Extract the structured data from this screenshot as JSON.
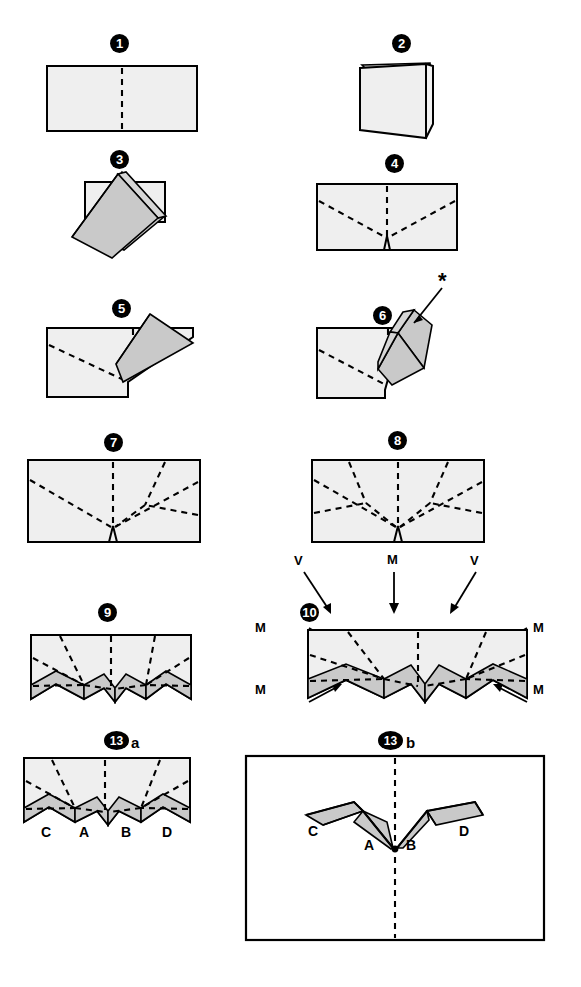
{
  "document": {
    "type": "origami-folding-instructions",
    "width": 581,
    "height": 987,
    "background": "#ffffff",
    "paper_fill": "#efefef",
    "shaded_fill": "#c9c9c9",
    "line_color": "#000000"
  },
  "steps": [
    {
      "id": "step-1",
      "badge": "1",
      "sublabel": "",
      "description": "flat rectangle with vertical center crease"
    },
    {
      "id": "step-2",
      "badge": "2",
      "sublabel": "",
      "description": "paper folded in half standing open like a book"
    },
    {
      "id": "step-3",
      "badge": "3",
      "sublabel": "",
      "description": "diagonal fold pulled down to the left"
    },
    {
      "id": "step-4",
      "badge": "4",
      "sublabel": "",
      "description": "rectangle with V creases meeting at bottom notch"
    },
    {
      "id": "step-5",
      "badge": "5",
      "sublabel": "",
      "description": "shaded flap swung up to the right"
    },
    {
      "id": "step-6",
      "badge": "6",
      "sublabel": "",
      "description": "flap refolded, asterisk marks new crease"
    },
    {
      "id": "step-7",
      "badge": "7",
      "sublabel": "",
      "description": "extra creases fanned on the right half"
    },
    {
      "id": "step-8",
      "badge": "8",
      "sublabel": "",
      "description": "symmetric fan creases on both halves"
    },
    {
      "id": "step-9",
      "badge": "9",
      "sublabel": "",
      "description": "shaded zigzag bands formed along the lower edge"
    },
    {
      "id": "step-10",
      "badge": "10",
      "sublabel": "",
      "description": "mountain and valley assignment with arrows"
    },
    {
      "id": "step-13a",
      "badge": "13",
      "sublabel": "a",
      "description": "labelled flaps C A B D before collapse"
    },
    {
      "id": "step-13b",
      "badge": "13",
      "sublabel": "b",
      "description": "finished wing form inside frame"
    }
  ],
  "annotations": {
    "asterisk": "*",
    "fold_markers": [
      {
        "label": "V",
        "position": "top-left"
      },
      {
        "label": "M",
        "position": "top-center"
      },
      {
        "label": "V",
        "position": "top-right"
      },
      {
        "label": "M",
        "position": "left-upper"
      },
      {
        "label": "M",
        "position": "right-upper"
      },
      {
        "label": "M",
        "position": "left-lower"
      },
      {
        "label": "M",
        "position": "right-lower"
      }
    ],
    "flap_labels_13a": [
      "C",
      "A",
      "B",
      "D"
    ],
    "flap_labels_13b": [
      "C",
      "A",
      "B",
      "D"
    ]
  },
  "legend": {
    "mountain": "M",
    "valley": "V"
  }
}
